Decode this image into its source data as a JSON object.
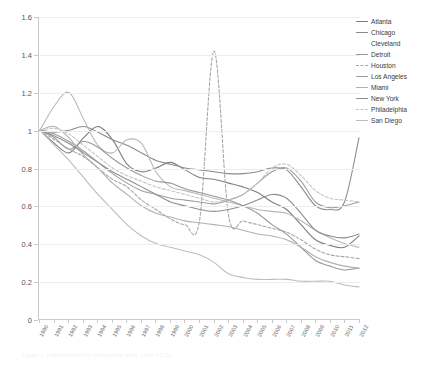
{
  "caption": "Figure 1.  Indexed trend by metropolitan area, 1990 = 1.00",
  "legend": {
    "position": "right",
    "entries": [
      {
        "label": "Atlanta",
        "color": "#7f7f7f",
        "style": "solid"
      },
      {
        "label": "Chicago",
        "color": "#8c8c8c",
        "style": "solid"
      },
      {
        "label": "Cleveland",
        "color": "#ffffff",
        "style": "blank"
      },
      {
        "label": "Detroit",
        "color": "#999999",
        "style": "solid"
      },
      {
        "label": "Houston",
        "color": "#a6a6a6",
        "style": "dashed"
      },
      {
        "label": "Los Angeles",
        "color": "#9e9e9e",
        "style": "solid"
      },
      {
        "label": "Miami",
        "color": "#b0b0b0",
        "style": "solid"
      },
      {
        "label": "New York",
        "color": "#8f8f8f",
        "style": "solid"
      },
      {
        "label": "Philadelphia",
        "color": "#c4c4c4",
        "style": "dashed"
      },
      {
        "label": "San Diego",
        "color": "#bdbdbd",
        "style": "solid"
      }
    ]
  },
  "chart_data": {
    "type": "line",
    "title": "",
    "xlabel": "",
    "ylabel": "",
    "ylim": [
      0,
      1.6
    ],
    "yticks": [
      "0",
      "0.2",
      "0.4",
      "0.6",
      "0.8",
      "1",
      "1.2",
      "1.4",
      "1.6"
    ],
    "ytick_values": [
      0,
      0.2,
      0.4,
      0.6,
      0.8,
      1.0,
      1.2,
      1.4,
      1.6
    ],
    "grid": true,
    "x": [
      1990,
      1991,
      1992,
      1993,
      1994,
      1995,
      1996,
      1997,
      1998,
      1999,
      2000,
      2001,
      2002,
      2003,
      2004,
      2005,
      2006,
      2007,
      2008,
      2009,
      2010,
      2011,
      2012
    ],
    "categories": [
      "1990",
      "1991",
      "1992",
      "1993",
      "1994",
      "1995",
      "1996",
      "1997",
      "1998",
      "1999",
      "2000",
      "2001",
      "2002",
      "2003",
      "2004",
      "2005",
      "2006",
      "2007",
      "2008",
      "2009",
      "2010",
      "2011",
      "2012"
    ],
    "series": [
      {
        "name": "Atlanta",
        "color": "#7f7f7f",
        "style": "solid",
        "values": [
          1.0,
          0.93,
          0.88,
          0.96,
          1.02,
          0.95,
          0.82,
          0.78,
          0.8,
          0.83,
          0.79,
          0.75,
          0.74,
          0.72,
          0.7,
          0.67,
          0.62,
          0.58,
          0.5,
          0.42,
          0.39,
          0.38,
          0.44
        ]
      },
      {
        "name": "Chicago",
        "color": "#8c8c8c",
        "style": "solid",
        "values": [
          1.0,
          0.99,
          1.0,
          1.02,
          0.99,
          0.95,
          0.92,
          0.88,
          0.84,
          0.82,
          0.8,
          0.79,
          0.78,
          0.77,
          0.77,
          0.78,
          0.8,
          0.79,
          0.7,
          0.6,
          0.58,
          0.62,
          0.96
        ]
      },
      {
        "name": "Cleveland",
        "color": "#b8b8b8",
        "style": "solid",
        "values": [
          1.0,
          1.13,
          1.2,
          1.06,
          0.92,
          0.88,
          0.95,
          0.93,
          0.78,
          0.7,
          0.68,
          0.66,
          0.64,
          0.62,
          0.6,
          0.58,
          0.57,
          0.56,
          0.52,
          0.47,
          0.43,
          0.4,
          0.38
        ]
      },
      {
        "name": "Detroit",
        "color": "#999999",
        "style": "solid",
        "values": [
          1.0,
          0.96,
          0.9,
          0.94,
          0.91,
          0.85,
          0.8,
          0.76,
          0.73,
          0.72,
          0.69,
          0.67,
          0.65,
          0.63,
          0.6,
          0.56,
          0.5,
          0.45,
          0.38,
          0.31,
          0.28,
          0.26,
          0.27
        ]
      },
      {
        "name": "Houston",
        "color": "#a6a6a6",
        "style": "dashed",
        "values": [
          1.0,
          0.95,
          0.9,
          0.86,
          0.8,
          0.74,
          0.7,
          0.63,
          0.58,
          0.53,
          0.5,
          0.52,
          1.42,
          0.55,
          0.52,
          0.5,
          0.48,
          0.46,
          0.42,
          0.37,
          0.34,
          0.33,
          0.32
        ]
      },
      {
        "name": "Los Angeles",
        "color": "#9e9e9e",
        "style": "solid",
        "values": [
          1.0,
          0.98,
          0.94,
          0.89,
          0.83,
          0.77,
          0.72,
          0.68,
          0.66,
          0.64,
          0.63,
          0.62,
          0.61,
          0.63,
          0.66,
          0.72,
          0.78,
          0.8,
          0.73,
          0.62,
          0.59,
          0.6,
          0.62
        ]
      },
      {
        "name": "Miami",
        "color": "#b0b0b0",
        "style": "solid",
        "values": [
          1.0,
          1.02,
          0.96,
          0.87,
          0.8,
          0.72,
          0.66,
          0.6,
          0.56,
          0.54,
          0.52,
          0.51,
          0.5,
          0.49,
          0.47,
          0.45,
          0.44,
          0.42,
          0.38,
          0.33,
          0.3,
          0.28,
          0.27
        ]
      },
      {
        "name": "New York",
        "color": "#8f8f8f",
        "style": "solid",
        "values": [
          1.0,
          0.97,
          0.93,
          0.88,
          0.83,
          0.78,
          0.74,
          0.7,
          0.66,
          0.62,
          0.6,
          0.58,
          0.57,
          0.58,
          0.6,
          0.63,
          0.66,
          0.64,
          0.56,
          0.47,
          0.44,
          0.43,
          0.45
        ]
      },
      {
        "name": "Philadelphia",
        "color": "#c4c4c4",
        "style": "dashed",
        "values": [
          1.0,
          1.01,
          0.98,
          0.92,
          0.86,
          0.8,
          0.76,
          0.73,
          0.7,
          0.68,
          0.66,
          0.64,
          0.62,
          0.63,
          0.66,
          0.72,
          0.8,
          0.82,
          0.76,
          0.68,
          0.64,
          0.63,
          0.62
        ]
      },
      {
        "name": "San Diego",
        "color": "#bdbdbd",
        "style": "solid",
        "values": [
          1.0,
          0.92,
          0.84,
          0.75,
          0.66,
          0.58,
          0.5,
          0.44,
          0.4,
          0.38,
          0.36,
          0.34,
          0.3,
          0.24,
          0.22,
          0.21,
          0.21,
          0.21,
          0.2,
          0.2,
          0.2,
          0.18,
          0.17
        ]
      }
    ]
  }
}
